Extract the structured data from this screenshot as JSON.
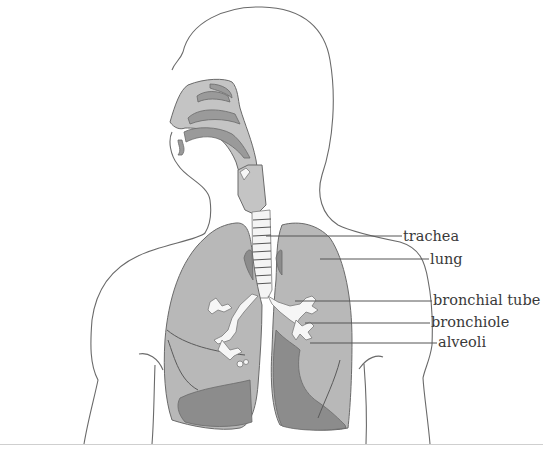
{
  "diagram": {
    "labels": [
      {
        "id": "trachea",
        "text": "trachea",
        "x": 403,
        "y": 229
      },
      {
        "id": "lung",
        "text": "lung",
        "x": 430,
        "y": 253
      },
      {
        "id": "bronchial-tube",
        "text": "bronchial tube",
        "x": 433,
        "y": 290
      },
      {
        "id": "bronchiole",
        "text": "bronchiole",
        "x": 431,
        "y": 316
      },
      {
        "id": "alveoli",
        "text": "alveoli",
        "x": 438,
        "y": 336
      }
    ],
    "colors": {
      "background": "#ffffff",
      "outline": "#6a6a6a",
      "lung_fill": "#b8b8b8",
      "lung_shadow": "#8c8c8c",
      "airway_fill": "#c4c4c4",
      "bronchi_fill": "#f6f6f6",
      "label_text": "#3a3a3a"
    }
  }
}
